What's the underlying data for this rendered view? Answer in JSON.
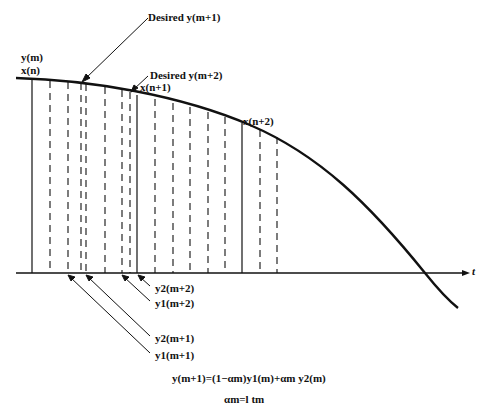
{
  "diagram": {
    "type": "signal-interpolation",
    "axis": {
      "t_label": "t"
    },
    "curve_labels": {
      "y_m": "y(m)",
      "x_n": "x(n)",
      "x_n1": "x(n+1)",
      "x_n2": "x(n+2)"
    },
    "desired_labels": {
      "desired_m1": "Desired y(m+1)",
      "desired_m2": "Desired y(m+2)"
    },
    "sample_labels": {
      "y2_m2": "y2(m+2)",
      "y1_m2": "y1(m+2)",
      "y2_m1": "y2(m+1)",
      "y1_m1": "y1(m+1)"
    },
    "equations": {
      "eq1": "y(m+1)=(1−αm)y1(m)+αm y2(m)",
      "eq2": "αm=l tm"
    },
    "solid_lines_x": [
      32,
      137,
      242
    ],
    "dashed_lines_x": [
      50,
      68,
      81,
      86,
      105,
      122,
      130,
      155,
      173,
      190,
      208,
      225,
      260,
      277
    ]
  }
}
